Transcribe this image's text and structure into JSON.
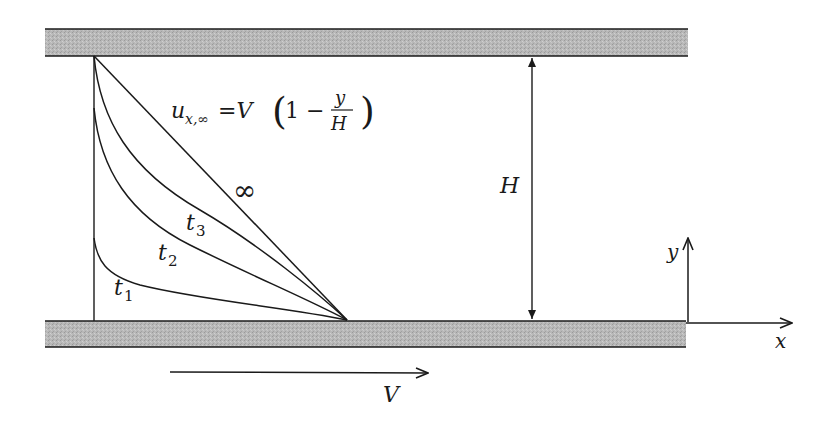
{
  "diagram": {
    "walls": [
      {
        "name": "top-wall",
        "fill": "#b5b5b5",
        "stationary": true
      },
      {
        "name": "bottom-wall",
        "fill": "#b5b5b5",
        "moving": true
      }
    ],
    "labels": {
      "formula_u": "u",
      "formula_sub": "x,∞",
      "formula_eq": "=V",
      "formula_paren_open": "(",
      "formula_one_minus": "1 −",
      "formula_num": "y",
      "formula_den": "H",
      "formula_paren_close": ")",
      "infinity": "∞",
      "t3": "t",
      "t3_sub": "3",
      "t2": "t",
      "t2_sub": "2",
      "t1": "t",
      "t1_sub": "1",
      "gap": "H",
      "y_axis": "y",
      "x_axis": "x",
      "velocity": "V"
    },
    "profiles": [
      {
        "name": "t1",
        "start_fraction_of_H": 0.31
      },
      {
        "name": "t2",
        "start_fraction_of_H": 0.8
      },
      {
        "name": "t3",
        "start_fraction_of_H": 1.0
      },
      {
        "name": "infinity",
        "shape": "linear",
        "start_fraction_of_H": 1.0
      }
    ],
    "colors": {
      "line": "#1a1a1a",
      "wall_fill": "#b5b5b5",
      "background": "#ffffff"
    }
  }
}
